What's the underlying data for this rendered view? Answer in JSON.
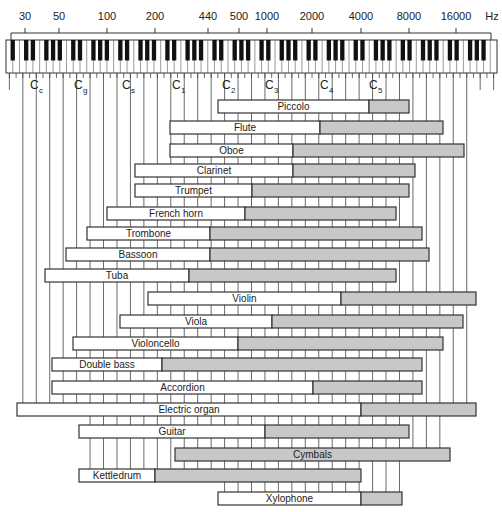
{
  "chart_data": {
    "type": "bar",
    "orientation": "horizontal-range",
    "title": "",
    "xlabel": "Hz",
    "ylabel": "",
    "x_scale": "log",
    "xlim": [
      27,
      20000
    ],
    "x_ticks": [
      30,
      50,
      100,
      200,
      440,
      500,
      1000,
      2000,
      4000,
      8000,
      16000
    ],
    "x_unit": "Hz",
    "note_labels": [
      {
        "base": "C",
        "sub": "c",
        "freq": 33
      },
      {
        "base": "C",
        "sub": "g",
        "freq": 65
      },
      {
        "base": "C",
        "sub": "s",
        "freq": 131
      },
      {
        "base": "C",
        "sub": "1",
        "freq": 262
      },
      {
        "base": "C",
        "sub": "2",
        "freq": 523
      },
      {
        "base": "C",
        "sub": "3",
        "freq": 1047
      },
      {
        "base": "C",
        "sub": "4",
        "freq": 2093
      },
      {
        "base": "C",
        "sub": "5",
        "freq": 4186
      }
    ],
    "legend": [
      {
        "name": "Fundamental range",
        "color": "#ffffff"
      },
      {
        "name": "Harmonics / overtone range",
        "color": "#c8c8c8"
      }
    ],
    "series": [
      {
        "name": "Piccolo",
        "low": 500,
        "fundamental_high": 4300,
        "high": 7700
      },
      {
        "name": "Flute",
        "low": 250,
        "fundamental_high": 2150,
        "high": 12600
      },
      {
        "name": "Oboe",
        "low": 250,
        "fundamental_high": 1450,
        "high": 17000
      },
      {
        "name": "Clarinet",
        "low": 150,
        "fundamental_high": 1450,
        "high": 8400
      },
      {
        "name": "Trumpet",
        "low": 150,
        "fundamental_high": 810,
        "high": 7700
      },
      {
        "name": "French horn",
        "low": 100,
        "fundamental_high": 730,
        "high": 6400
      },
      {
        "name": "Trombone",
        "low": 75,
        "fundamental_high": 440,
        "high": 9300
      },
      {
        "name": "Bassoon",
        "low": 55,
        "fundamental_high": 440,
        "high": 10300
      },
      {
        "name": "Tuba",
        "low": 41,
        "fundamental_high": 325,
        "high": 6400
      },
      {
        "name": "Violin",
        "low": 180,
        "fundamental_high": 2900,
        "high": 20000
      },
      {
        "name": "Viola",
        "low": 120,
        "fundamental_high": 1070,
        "high": 16800
      },
      {
        "name": "Violoncello",
        "low": 61,
        "fundamental_high": 660,
        "high": 12600
      },
      {
        "name": "Double bass",
        "low": 45,
        "fundamental_high": 210,
        "high": 9300
      },
      {
        "name": "Accordion",
        "low": 45,
        "fundamental_high": 1950,
        "high": 9300
      },
      {
        "name": "Electric organ",
        "low": 27,
        "fundamental_high": 3870,
        "high": 20000
      },
      {
        "name": "Guitar",
        "low": 67,
        "fundamental_high": 970,
        "high": 7700
      },
      {
        "name": "Cymbals",
        "low": 270,
        "fundamental_high": 270,
        "high": 13900
      },
      {
        "name": "Kettledrum",
        "low": 67,
        "fundamental_high": 200,
        "high": 3870
      },
      {
        "name": "Xylophone",
        "low": 500,
        "fundamental_high": 3870,
        "high": 7000
      }
    ]
  },
  "layout_px": {
    "tick_x": [
      25,
      59,
      107,
      155,
      208,
      239,
      267,
      312,
      361,
      409,
      456
    ],
    "hz_label_x": 492,
    "keyboard": {
      "x": 6,
      "y": 40,
      "w": 491,
      "h": 33,
      "white_keys": 73
    },
    "note_label_x": [
      30,
      74,
      122,
      172,
      222,
      265,
      320,
      369
    ],
    "rows": [
      {
        "y": 100,
        "x0": 218,
        "xs": 369,
        "x1": 409
      },
      {
        "y": 121,
        "x0": 170,
        "xs": 320,
        "x1": 443
      },
      {
        "y": 144,
        "x0": 170,
        "xs": 293,
        "x1": 464
      },
      {
        "y": 164,
        "x0": 135,
        "xs": 293,
        "x1": 415
      },
      {
        "y": 184,
        "x0": 135,
        "xs": 252,
        "x1": 409
      },
      {
        "y": 207,
        "x0": 107,
        "xs": 245,
        "x1": 396
      },
      {
        "y": 227,
        "x0": 87,
        "xs": 210,
        "x1": 422
      },
      {
        "y": 248,
        "x0": 66,
        "xs": 210,
        "x1": 429
      },
      {
        "y": 269,
        "x0": 45,
        "xs": 189,
        "x1": 396
      },
      {
        "y": 292,
        "x0": 148,
        "xs": 341,
        "x1": 476
      },
      {
        "y": 315,
        "x0": 120,
        "xs": 272,
        "x1": 463
      },
      {
        "y": 337,
        "x0": 73,
        "xs": 238,
        "x1": 443
      },
      {
        "y": 358,
        "x0": 52,
        "xs": 162,
        "x1": 422
      },
      {
        "y": 381,
        "x0": 52,
        "xs": 313,
        "x1": 422
      },
      {
        "y": 403,
        "x0": 17,
        "xs": 361,
        "x1": 476
      },
      {
        "y": 425,
        "x0": 79,
        "xs": 265,
        "x1": 409
      },
      {
        "y": 448,
        "x0": 175,
        "xs": 175,
        "x1": 450
      },
      {
        "y": 469,
        "x0": 79,
        "xs": 155,
        "x1": 361
      },
      {
        "y": 492,
        "x0": 218,
        "xs": 361,
        "x1": 402
      }
    ],
    "bar_h": 13
  },
  "colors": {
    "line": "#333333",
    "harmonic_fill": "#c8c8c8",
    "fundamental_fill": "#ffffff",
    "black_key": "#111111"
  }
}
